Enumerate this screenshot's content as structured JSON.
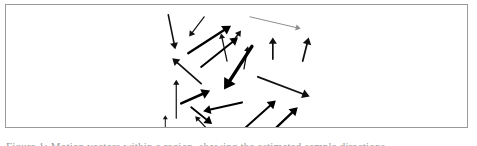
{
  "figure": {
    "panel_name": "vector-field-panel",
    "background_color": "#ffffff",
    "border_color": "#9a9a9a",
    "arrow_color": "#000000",
    "faint_arrow_color": "#8d8d8d",
    "caption_text": "Figure 1: Motion vectors within a region, showing the estimated sample directions"
  },
  "chart_data": {
    "type": "scatter",
    "title": "",
    "xlabel": "",
    "ylabel": "",
    "grid": false,
    "legend": null,
    "xlim": [
      0,
      463
    ],
    "ylim": [
      0,
      124
    ],
    "arrows": [
      {
        "id": "arrow-01",
        "x1": 163,
        "y1": 10,
        "x2": 170,
        "y2": 45,
        "width": 1.6,
        "head": 6.5,
        "color": "#101010"
      },
      {
        "id": "arrow-02",
        "x1": 199,
        "y1": 12,
        "x2": 184,
        "y2": 32,
        "width": 1.2,
        "head": 5.5,
        "color": "#101010"
      },
      {
        "id": "arrow-03",
        "x1": 183,
        "y1": 49,
        "x2": 226,
        "y2": 21,
        "width": 2.3,
        "head": 8.5,
        "color": "#000000"
      },
      {
        "id": "arrow-04",
        "x1": 196,
        "y1": 63,
        "x2": 233,
        "y2": 33,
        "width": 2.0,
        "head": 7.5,
        "color": "#000000"
      },
      {
        "id": "arrow-05",
        "x1": 245,
        "y1": 12,
        "x2": 296,
        "y2": 24,
        "width": 1.0,
        "head": 5.0,
        "color": "#8d8d8d"
      },
      {
        "id": "arrow-06",
        "x1": 268,
        "y1": 55,
        "x2": 268,
        "y2": 33,
        "width": 1.7,
        "head": 6.5,
        "color": "#101010"
      },
      {
        "id": "arrow-07",
        "x1": 298,
        "y1": 57,
        "x2": 304,
        "y2": 33,
        "width": 1.8,
        "head": 7.0,
        "color": "#101010"
      },
      {
        "id": "arrow-08",
        "x1": 196,
        "y1": 80,
        "x2": 167,
        "y2": 54,
        "width": 1.7,
        "head": 7.0,
        "color": "#101010"
      },
      {
        "id": "arrow-09",
        "x1": 239,
        "y1": 65,
        "x2": 243,
        "y2": 42,
        "width": 1.3,
        "head": 5.0,
        "color": "#101010"
      },
      {
        "id": "arrow-10",
        "x1": 247,
        "y1": 42,
        "x2": 219,
        "y2": 86,
        "width": 3.4,
        "head": 11.0,
        "color": "#000000"
      },
      {
        "id": "arrow-11",
        "x1": 171,
        "y1": 115,
        "x2": 171,
        "y2": 76,
        "width": 1.2,
        "head": 5.0,
        "color": "#101010"
      },
      {
        "id": "arrow-12",
        "x1": 176,
        "y1": 100,
        "x2": 205,
        "y2": 87,
        "width": 2.6,
        "head": 8.5,
        "color": "#000000"
      },
      {
        "id": "arrow-13",
        "x1": 253,
        "y1": 73,
        "x2": 305,
        "y2": 93,
        "width": 1.9,
        "head": 7.5,
        "color": "#101010"
      },
      {
        "id": "arrow-14",
        "x1": 237,
        "y1": 99,
        "x2": 198,
        "y2": 108,
        "width": 2.1,
        "head": 7.5,
        "color": "#000000"
      },
      {
        "id": "arrow-15",
        "x1": 186,
        "y1": 104,
        "x2": 207,
        "y2": 121,
        "width": 1.9,
        "head": 7.5,
        "color": "#000000"
      },
      {
        "id": "arrow-16",
        "x1": 239,
        "y1": 126,
        "x2": 271,
        "y2": 97,
        "width": 2.0,
        "head": 8.0,
        "color": "#000000"
      },
      {
        "id": "arrow-17",
        "x1": 272,
        "y1": 124,
        "x2": 293,
        "y2": 104,
        "width": 2.4,
        "head": 8.0,
        "color": "#000000"
      },
      {
        "id": "arrow-18",
        "x1": 222,
        "y1": 57,
        "x2": 216,
        "y2": 29,
        "width": 1.3,
        "head": 5.0,
        "color": "#101010"
      },
      {
        "id": "arrow-19",
        "x1": 230,
        "y1": 34,
        "x2": 236,
        "y2": 26,
        "width": 1.5,
        "head": 5.5,
        "color": "#101010"
      },
      {
        "id": "arrow-20",
        "x1": 203,
        "y1": 127,
        "x2": 190,
        "y2": 113,
        "width": 1.2,
        "head": 5.0,
        "color": "#101010"
      },
      {
        "id": "arrow-21",
        "x1": 160,
        "y1": 124,
        "x2": 160,
        "y2": 112,
        "width": 1.0,
        "head": 4.0,
        "color": "#101010"
      }
    ]
  }
}
